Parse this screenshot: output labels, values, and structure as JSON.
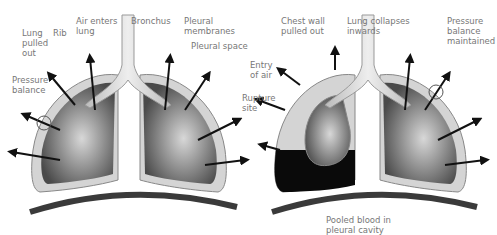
{
  "header": {
    "title_partial": "...pp..."
  },
  "left_panel": {
    "labels": {
      "lung_pulled_out": "Lung\npulled\nout",
      "rib": "Rib",
      "air_enters_lung": "Air enters\nlung",
      "bronchus": "Bronchus",
      "pleural_membranes": "Pleural\nmembranes",
      "pleural_space": "Pleural space",
      "pressure_balance": "Pressure\nbalance"
    }
  },
  "right_panel": {
    "labels": {
      "chest_wall_pulled_out": "Chest wall\npulled out",
      "lung_collapses_inwards": "Lung collapses\ninwards",
      "pressure_balance_maintained": "Pressure\nbalance\nmaintained",
      "entry_of_air": "Entry\nof air",
      "rupture_site": "Rupture\nsite",
      "pooled_blood": "Pooled blood in\npleural cavity"
    }
  },
  "colors": {
    "lung_dark": "#4a4a4a",
    "lung_light": "#c8c8c8",
    "pleura": "#d4d4d4",
    "blood": "#0a0a0a",
    "diaphragm": "#3a3a3a",
    "label": "#777777"
  }
}
